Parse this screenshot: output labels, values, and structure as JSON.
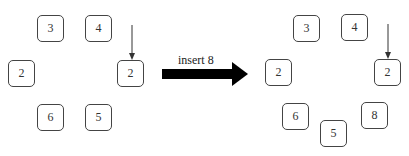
{
  "before": {
    "nodes": [
      {
        "value": "3",
        "x": 37,
        "y": 15
      },
      {
        "value": "4",
        "x": 85,
        "y": 15
      },
      {
        "value": "2",
        "x": 8,
        "y": 60
      },
      {
        "value": "2",
        "x": 117,
        "y": 60
      },
      {
        "value": "6",
        "x": 37,
        "y": 104
      },
      {
        "value": "5",
        "x": 85,
        "y": 104
      }
    ],
    "pointer": {
      "x": 132,
      "y1": 26,
      "y2": 60,
      "target_index": 3
    }
  },
  "operation": {
    "label": "insert 8",
    "arrow_color": "#000000"
  },
  "after": {
    "nodes": [
      {
        "value": "3",
        "x": 293,
        "y": 15
      },
      {
        "value": "4",
        "x": 341,
        "y": 14
      },
      {
        "value": "2",
        "x": 265,
        "y": 59
      },
      {
        "value": "2",
        "x": 374,
        "y": 59
      },
      {
        "value": "6",
        "x": 282,
        "y": 103
      },
      {
        "value": "5",
        "x": 320,
        "y": 120
      },
      {
        "value": "8",
        "x": 361,
        "y": 102
      }
    ],
    "pointer": {
      "x": 388,
      "y1": 25,
      "y2": 59,
      "target_index": 3
    }
  }
}
